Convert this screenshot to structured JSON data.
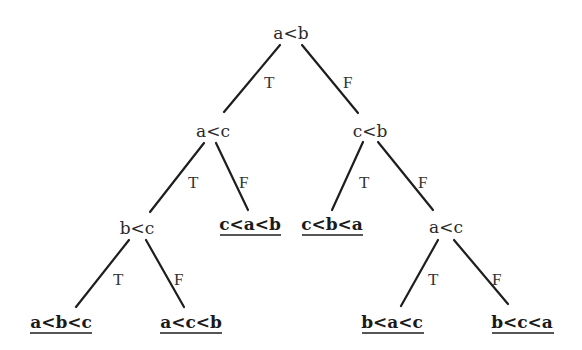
{
  "diagram": {
    "type": "decision-tree",
    "nodes": {
      "root": {
        "label": "a<b"
      },
      "n_left": {
        "label": "a<c"
      },
      "n_right": {
        "label": "c<b"
      },
      "n_left_left": {
        "label": "b<c"
      },
      "n_right_right": {
        "label": "a<c"
      }
    },
    "leaves": {
      "abc": {
        "label": "a<b<c"
      },
      "acb": {
        "label": "a<c<b"
      },
      "cab": {
        "label": "c<a<b"
      },
      "cba": {
        "label": "c<b<a"
      },
      "bac": {
        "label": "b<a<c"
      },
      "bca": {
        "label": "b<c<a"
      }
    },
    "edges": [
      {
        "from": "a<b",
        "to": "a<c",
        "label": "T"
      },
      {
        "from": "a<b",
        "to": "c<b",
        "label": "F"
      },
      {
        "from": "a<c",
        "to": "b<c",
        "label": "T"
      },
      {
        "from": "a<c",
        "to": "c<a<b",
        "label": "F"
      },
      {
        "from": "c<b",
        "to": "c<b<a",
        "label": "T"
      },
      {
        "from": "c<b",
        "to": "a<c",
        "label": "F"
      },
      {
        "from": "b<c",
        "to": "a<b<c",
        "label": "T"
      },
      {
        "from": "b<c",
        "to": "a<c<b",
        "label": "F"
      },
      {
        "from": "a<c",
        "to": "b<a<c",
        "label": "T"
      },
      {
        "from": "a<c",
        "to": "b<c<a",
        "label": "F"
      }
    ],
    "colors": {
      "line": "#1e1e1e",
      "text": "#2a2a2a",
      "background": "#ffffff"
    }
  }
}
